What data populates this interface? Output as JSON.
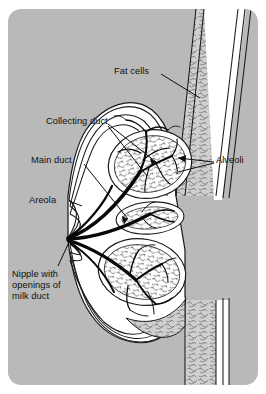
{
  "figure": {
    "type": "anatomical-diagram",
    "panel_background": "#b9b9b9",
    "outer_background": "#ffffff",
    "ink_color": "#111111",
    "tissue_fill": "#ffffff"
  },
  "labels": {
    "fat_cells": "Fat cells",
    "collecting_duct": "Collecting duct",
    "main_duct": "Main duct",
    "alveoli": "Alveoli",
    "areola": "Areola",
    "nipple_line1": "Nipple with",
    "nipple_line2": "openings of",
    "nipple_line3": "milk duct"
  },
  "structures": [
    {
      "name": "chest-wall",
      "description": "stippled fatty band running top-right to bottom-right"
    },
    {
      "name": "upper-lobule",
      "description": "large oval gland lobe with branching ducts and alveolar clusters"
    },
    {
      "name": "lower-lobule",
      "description": "second oval gland lobe below the first"
    },
    {
      "name": "duct-tree",
      "description": "dark branching ducts converging to the nipple"
    },
    {
      "name": "nipple",
      "description": "convergence point of all milk ducts at the left apex"
    },
    {
      "name": "areola",
      "description": "skin region surrounding the nipple"
    },
    {
      "name": "inframammary-fold",
      "description": "crease where the breast meets the chest wall"
    }
  ]
}
